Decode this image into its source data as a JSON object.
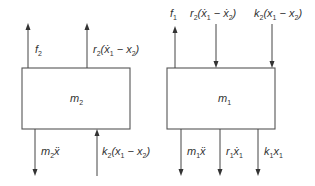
{
  "diagram": {
    "type": "free-body-diagram",
    "colors": {
      "stroke": "#555555",
      "text": "#333333",
      "background": "#ffffff"
    },
    "bodies": [
      {
        "id": "mass2",
        "label": "m",
        "label_sub": "2",
        "forces_top": [
          {
            "id": "f2",
            "direction": "up",
            "parts": [
              [
                "f",
                ""
              ],
              [
                "2",
                "sub"
              ]
            ]
          },
          {
            "id": "r2-damper-top",
            "direction": "up",
            "parts": [
              [
                "r",
                ""
              ],
              [
                "2",
                "sub"
              ],
              [
                "(ẋ",
                ""
              ],
              [
                "1",
                "sub"
              ],
              [
                " − x",
                ""
              ],
              [
                "2",
                "sub"
              ],
              [
                ")",
                ""
              ]
            ]
          }
        ],
        "forces_bottom": [
          {
            "id": "m2-inertia",
            "direction": "down",
            "parts": [
              [
                "m",
                ""
              ],
              [
                "2",
                "sub"
              ],
              [
                "ẍ",
                ""
              ]
            ]
          },
          {
            "id": "k2-spring-bottom",
            "direction": "up",
            "parts": [
              [
                "k",
                ""
              ],
              [
                "2",
                "sub"
              ],
              [
                "(x",
                ""
              ],
              [
                "1",
                "sub"
              ],
              [
                " − x",
                ""
              ],
              [
                "2",
                "sub"
              ],
              [
                ")",
                ""
              ]
            ]
          }
        ]
      },
      {
        "id": "mass1",
        "label": "m",
        "label_sub": "1",
        "forces_top": [
          {
            "id": "f1",
            "direction": "up",
            "parts": [
              [
                "f",
                ""
              ],
              [
                "1",
                "sub"
              ]
            ]
          },
          {
            "id": "r2-damper-top-m1",
            "direction": "down",
            "parts": [
              [
                "r",
                ""
              ],
              [
                "2",
                "sub"
              ],
              [
                "(ẋ",
                ""
              ],
              [
                "1",
                "sub"
              ],
              [
                " − ẋ",
                ""
              ],
              [
                "2",
                "sub"
              ],
              [
                ")",
                ""
              ]
            ]
          },
          {
            "id": "k2-spring-top-m1",
            "direction": "down",
            "parts": [
              [
                "k",
                ""
              ],
              [
                "2",
                "sub"
              ],
              [
                "(x",
                ""
              ],
              [
                "1",
                "sub"
              ],
              [
                " − x",
                ""
              ],
              [
                "2",
                "sub"
              ],
              [
                ")",
                ""
              ]
            ]
          }
        ],
        "forces_bottom": [
          {
            "id": "m1-inertia",
            "direction": "down",
            "parts": [
              [
                "m",
                ""
              ],
              [
                "1",
                "sub"
              ],
              [
                "ẍ",
                ""
              ]
            ]
          },
          {
            "id": "r1-damper",
            "direction": "down",
            "parts": [
              [
                "r",
                ""
              ],
              [
                "1",
                "sub"
              ],
              [
                "ẋ",
                ""
              ],
              [
                "1",
                "sub"
              ]
            ]
          },
          {
            "id": "k1-spring",
            "direction": "down",
            "parts": [
              [
                "k",
                ""
              ],
              [
                "1",
                "sub"
              ],
              [
                "x",
                ""
              ],
              [
                "1",
                "sub"
              ]
            ]
          }
        ]
      }
    ]
  }
}
